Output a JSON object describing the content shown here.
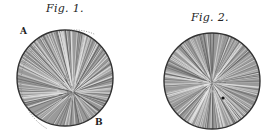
{
  "figures": [
    {
      "label": "Fig. 1.",
      "center": [
        65,
        78
      ],
      "radius": 48,
      "markers": [
        {
          "text": "A",
          "x": 21,
          "y": 30
        },
        {
          "text": "B",
          "x": 95,
          "y": 117
        }
      ],
      "has_dotted_arc": true
    },
    {
      "label": "Fig. 2.",
      "center": [
        212,
        81
      ],
      "radius": 48,
      "markers": [],
      "dot": [
        223,
        98
      ]
    }
  ],
  "colors": {
    "ink": "#222222",
    "fill": "#8a8a8a",
    "background": "#ffffff"
  }
}
